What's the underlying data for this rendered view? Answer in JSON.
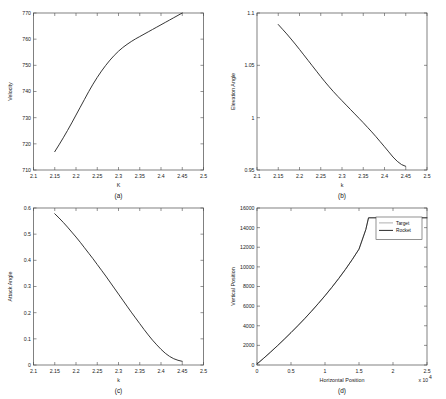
{
  "figure": {
    "caption": "",
    "background": "#ffffff",
    "curve_color": "#2b2b2b"
  },
  "panels": [
    {
      "id": "a",
      "caption": "(a)"
    },
    {
      "id": "b",
      "caption": "(b)"
    },
    {
      "id": "c",
      "caption": "(c)"
    },
    {
      "id": "d",
      "caption": "(d)"
    }
  ],
  "chart_data": [
    {
      "type": "line",
      "panel": "(a)",
      "title": "",
      "xlabel": "K",
      "ylabel": "Velocity",
      "xlim": [
        2.1,
        2.5
      ],
      "ylim": [
        710,
        770
      ],
      "xticks": [
        2.1,
        2.15,
        2.2,
        2.25,
        2.3,
        2.35,
        2.4,
        2.45,
        2.5
      ],
      "xticklabels": [
        "2.1",
        "2.15",
        "2.2",
        "2.25",
        "2.3",
        "2.35",
        "2.4",
        "2.45",
        "2.5"
      ],
      "yticks": [
        710,
        720,
        730,
        740,
        750,
        760,
        770
      ],
      "yticklabels": [
        "710",
        "720",
        "730",
        "740",
        "750",
        "760",
        "770"
      ],
      "grid": false,
      "legend": null,
      "series": [
        {
          "name": "Velocity",
          "x": [
            2.15,
            2.16,
            2.17,
            2.18,
            2.19,
            2.2,
            2.21,
            2.22,
            2.23,
            2.24,
            2.25,
            2.26,
            2.27,
            2.28,
            2.29,
            2.3,
            2.31,
            2.32,
            2.33,
            2.34,
            2.35,
            2.36,
            2.37,
            2.38,
            2.39,
            2.4,
            2.41,
            2.42,
            2.43,
            2.44,
            2.45
          ],
          "y": [
            717.0,
            719.6,
            722.3,
            725.1,
            728.0,
            731.0,
            734.0,
            737.0,
            740.0,
            742.8,
            745.4,
            747.8,
            750.0,
            752.0,
            753.8,
            755.4,
            756.8,
            758.0,
            759.1,
            760.1,
            761.0,
            761.9,
            762.8,
            763.7,
            764.6,
            765.5,
            766.4,
            767.3,
            768.2,
            769.1,
            770.0
          ]
        }
      ]
    },
    {
      "type": "line",
      "panel": "(b)",
      "title": "",
      "xlabel": "k",
      "ylabel": "Elevation Angle",
      "xlim": [
        2.1,
        2.5
      ],
      "ylim": [
        0.95,
        1.1
      ],
      "xticks": [
        2.1,
        2.15,
        2.2,
        2.25,
        2.3,
        2.35,
        2.4,
        2.45,
        2.5
      ],
      "xticklabels": [
        "2.1",
        "2.15",
        "2.2",
        "2.25",
        "2.3",
        "2.35",
        "2.4",
        "2.45",
        "2.5"
      ],
      "yticks": [
        0.95,
        1.0,
        1.05,
        1.1
      ],
      "yticklabels": [
        "0.95",
        "1",
        "1.05",
        "1.1"
      ],
      "grid": false,
      "legend": null,
      "series": [
        {
          "name": "Elevation Angle",
          "x": [
            2.15,
            2.16,
            2.17,
            2.18,
            2.19,
            2.2,
            2.21,
            2.22,
            2.23,
            2.24,
            2.25,
            2.26,
            2.27,
            2.28,
            2.29,
            2.3,
            2.31,
            2.32,
            2.33,
            2.34,
            2.35,
            2.36,
            2.37,
            2.38,
            2.39,
            2.4,
            2.41,
            2.42,
            2.43,
            2.44,
            2.45
          ],
          "y": [
            1.089,
            1.0845,
            1.08,
            1.0752,
            1.0703,
            1.0652,
            1.06,
            1.0548,
            1.0496,
            1.0444,
            1.0392,
            1.0342,
            1.0294,
            1.0248,
            1.0204,
            1.0162,
            1.012,
            1.0078,
            1.0036,
            0.9994,
            0.9952,
            0.9908,
            0.9864,
            0.9818,
            0.977,
            0.9722,
            0.9673,
            0.9624,
            0.9583,
            0.9552,
            0.9535
          ]
        }
      ]
    },
    {
      "type": "line",
      "panel": "(c)",
      "title": "",
      "xlabel": "k",
      "ylabel": "Attack Angle",
      "xlim": [
        2.1,
        2.5
      ],
      "ylim": [
        0,
        0.6
      ],
      "xticks": [
        2.1,
        2.15,
        2.2,
        2.25,
        2.3,
        2.35,
        2.4,
        2.45,
        2.5
      ],
      "xticklabels": [
        "2.1",
        "2.15",
        "2.2",
        "2.25",
        "2.3",
        "2.35",
        "2.4",
        "2.45",
        "2.5"
      ],
      "yticks": [
        0,
        0.1,
        0.2,
        0.3,
        0.4,
        0.5,
        0.6
      ],
      "yticklabels": [
        "0",
        "0.1",
        "0.2",
        "0.3",
        "0.4",
        "0.5",
        "0.6"
      ],
      "grid": false,
      "legend": null,
      "series": [
        {
          "name": "Attack Angle",
          "x": [
            2.15,
            2.16,
            2.17,
            2.18,
            2.19,
            2.2,
            2.21,
            2.22,
            2.23,
            2.24,
            2.25,
            2.26,
            2.27,
            2.28,
            2.29,
            2.3,
            2.31,
            2.32,
            2.33,
            2.34,
            2.35,
            2.36,
            2.37,
            2.38,
            2.39,
            2.4,
            2.41,
            2.42,
            2.43,
            2.44,
            2.45
          ],
          "y": [
            0.578,
            0.562,
            0.545,
            0.527,
            0.508,
            0.489,
            0.469,
            0.448,
            0.427,
            0.406,
            0.384,
            0.362,
            0.34,
            0.317,
            0.294,
            0.271,
            0.248,
            0.225,
            0.202,
            0.18,
            0.158,
            0.136,
            0.115,
            0.095,
            0.077,
            0.06,
            0.045,
            0.033,
            0.024,
            0.018,
            0.014
          ]
        }
      ]
    },
    {
      "type": "line",
      "panel": "(d)",
      "title": "",
      "xlabel": "Horizontal Position",
      "ylabel": "Vertical Position",
      "x_multiplier": "x 10",
      "x_multiplier_exp": "4",
      "xlim": [
        0,
        25000
      ],
      "ylim": [
        0,
        16000
      ],
      "xticks": [
        0,
        5000,
        10000,
        15000,
        20000,
        25000
      ],
      "xticklabels": [
        "0",
        "0.5",
        "1",
        "1.5",
        "2",
        "2.5"
      ],
      "yticks": [
        0,
        2000,
        4000,
        6000,
        8000,
        10000,
        12000,
        14000,
        16000
      ],
      "yticklabels": [
        "0",
        "2000",
        "4000",
        "6000",
        "8000",
        "10000",
        "12000",
        "14000",
        "16000"
      ],
      "grid": false,
      "legend": {
        "position": "upper right",
        "entries": [
          "Target",
          "Rocket"
        ]
      },
      "series": [
        {
          "name": "Target",
          "x": [
            0,
            1000,
            2000,
            3000,
            4000,
            5000,
            6000,
            7000,
            8000,
            9000,
            10000,
            11000,
            12000,
            13000,
            14000,
            15000,
            16000,
            16400,
            18000,
            20000,
            22000,
            24000,
            25000
          ],
          "y": [
            100,
            700,
            1320,
            1960,
            2620,
            3300,
            4000,
            4720,
            5470,
            6250,
            7060,
            7910,
            8800,
            9740,
            10740,
            11810,
            13800,
            15000,
            15000,
            15000,
            15000,
            15000,
            15000
          ]
        },
        {
          "name": "Rocket",
          "x": [
            0,
            1000,
            2000,
            3000,
            4000,
            5000,
            6000,
            7000,
            8000,
            9000,
            10000,
            11000,
            12000,
            13000,
            14000,
            15000,
            16000,
            16400,
            18000,
            20000,
            22000,
            24000,
            25000
          ],
          "y": [
            100,
            700,
            1320,
            1960,
            2620,
            3300,
            4000,
            4720,
            5470,
            6250,
            7060,
            7910,
            8800,
            9740,
            10740,
            11810,
            13800,
            15000,
            15000,
            15000,
            15000,
            15000,
            15000
          ]
        }
      ]
    }
  ]
}
